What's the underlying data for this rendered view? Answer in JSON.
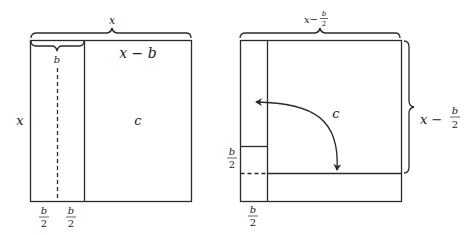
{
  "left_figure": {
    "top_brace_label": "x",
    "inner_brace_label": "b",
    "top_right_label": "x − b",
    "side_label": "x",
    "area_label": "c",
    "bottom_labels": [
      {
        "num": "b",
        "den": "2"
      },
      {
        "num": "b",
        "den": "2"
      }
    ]
  },
  "right_figure": {
    "top_brace_label": {
      "prefix": "x−",
      "num": "b",
      "den": "2"
    },
    "right_brace_label": {
      "prefix": "x − ",
      "num": "b",
      "den": "2"
    },
    "area_label": "c",
    "left_label": {
      "num": "b",
      "den": "2"
    },
    "bottom_label": {
      "num": "b",
      "den": "2"
    }
  },
  "colors": {
    "line": "#2a2a2a",
    "background": "#ffffff"
  }
}
